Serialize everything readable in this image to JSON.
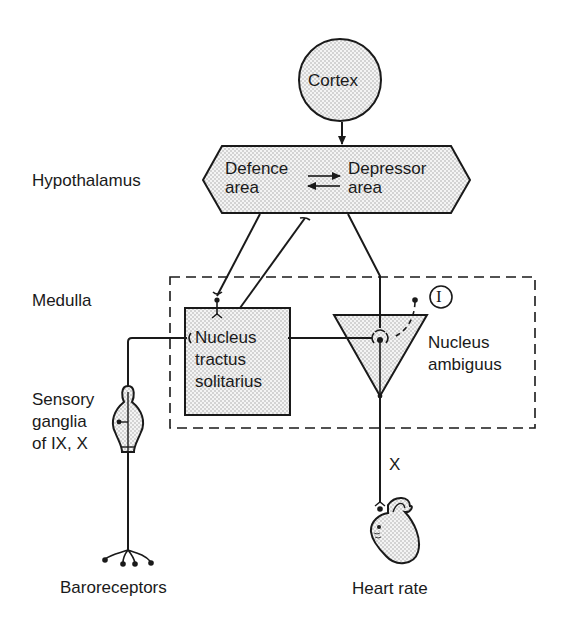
{
  "nodes": {
    "cortex": {
      "label": "Cortex"
    },
    "defence_area": {
      "line1": "Defence",
      "line2": "area"
    },
    "depressor_area": {
      "line1": "Depressor",
      "line2": "area"
    },
    "nts": {
      "line1": "Nucleus",
      "line2": "tractus",
      "line3": "solitarius"
    },
    "nucleus_ambiguus": {
      "line1": "Nucleus",
      "line2": "ambiguus"
    },
    "sensory_ganglia": {
      "line1": "Sensory",
      "line2": "ganglia",
      "line3": "of IX, X"
    },
    "baroreceptors": {
      "label": "Baroreceptors"
    },
    "heart": {
      "label": "Heart rate"
    }
  },
  "regions": {
    "hypothalamus": "Hypothalamus",
    "medulla": "Medulla"
  },
  "annotations": {
    "inhibitory_marker": "I",
    "vagus_nerve": "X"
  },
  "edges": [
    {
      "from": "Cortex",
      "to": "Hypothalamus",
      "type": "arrow"
    },
    {
      "from": "Defence area",
      "to": "Depressor area",
      "type": "reciprocal-arrows"
    },
    {
      "from": "Defence area",
      "to": "Nucleus tractus solitarius",
      "type": "synapse"
    },
    {
      "from": "Nucleus tractus solitarius",
      "to": "Defence area",
      "type": "synapse"
    },
    {
      "from": "Depressor area",
      "to": "Nucleus ambiguus",
      "type": "synapse"
    },
    {
      "from": "Nucleus tractus solitarius",
      "to": "Nucleus ambiguus",
      "type": "synapse"
    },
    {
      "from": "Inhibitory interneuron (I)",
      "to": "Nucleus ambiguus",
      "type": "dashed-synapse"
    },
    {
      "from": "Baroreceptors",
      "to": "Nucleus tractus solitarius",
      "type": "afferent via sensory ganglia"
    },
    {
      "from": "Nucleus ambiguus",
      "to": "Heart",
      "type": "efferent via X"
    }
  ],
  "colors": {
    "ink": "#1a1a1a",
    "fill": "#e4e4e4"
  }
}
